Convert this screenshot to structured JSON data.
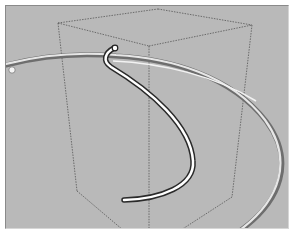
{
  "viewport": {
    "background": "#b9b9b9",
    "scene": {
      "objects": [
        {
          "type": "wireframe-box",
          "style": "dashed",
          "color": "#555555"
        },
        {
          "type": "curved-tube",
          "id": "outer-arc",
          "color": "#e8e8e8",
          "shadow": "#6e6e6e"
        },
        {
          "type": "curved-tube",
          "id": "inner-hook",
          "color": "#ffffff",
          "shadow": "#2a2a2a"
        }
      ]
    }
  }
}
